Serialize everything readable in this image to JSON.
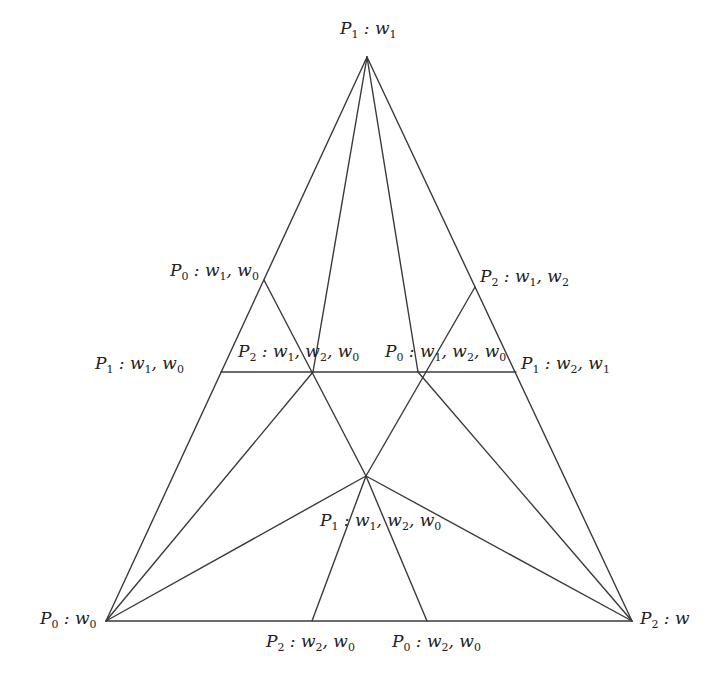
{
  "diagram": {
    "type": "triangulated-simplex",
    "stroke_color": "#3a3a3a",
    "background": "#ffffff",
    "points": {
      "top": {
        "x": 367,
        "y": 57
      },
      "bl": {
        "x": 106,
        "y": 621
      },
      "br": {
        "x": 632,
        "y": 621
      },
      "left_mid": {
        "x": 264,
        "y": 280
      },
      "right_mid": {
        "x": 475,
        "y": 287
      },
      "h_left": {
        "x": 221,
        "y": 372
      },
      "h_right": {
        "x": 516,
        "y": 372
      },
      "x_left": {
        "x": 313,
        "y": 372
      },
      "x_right": {
        "x": 418,
        "y": 372
      },
      "center": {
        "x": 366,
        "y": 476
      },
      "b_left": {
        "x": 312,
        "y": 621
      },
      "b_right": {
        "x": 427,
        "y": 621
      }
    },
    "edges": [
      [
        "top",
        "bl"
      ],
      [
        "top",
        "br"
      ],
      [
        "bl",
        "br"
      ],
      [
        "top",
        "x_left"
      ],
      [
        "top",
        "x_right"
      ],
      [
        "h_left",
        "h_right"
      ],
      [
        "left_mid",
        "center"
      ],
      [
        "right_mid",
        "center"
      ],
      [
        "bl",
        "x_left"
      ],
      [
        "br",
        "x_right"
      ],
      [
        "bl",
        "center"
      ],
      [
        "br",
        "center"
      ],
      [
        "center",
        "b_left"
      ],
      [
        "center",
        "b_right"
      ]
    ],
    "labels": [
      {
        "id": "top",
        "P": "1",
        "w": [
          "1"
        ],
        "x": 340,
        "y": 20
      },
      {
        "id": "left_mid",
        "P": "0",
        "w": [
          "1",
          "0"
        ],
        "x": 170,
        "y": 262
      },
      {
        "id": "right_mid",
        "P": "2",
        "w": [
          "1",
          "2"
        ],
        "x": 480,
        "y": 268
      },
      {
        "id": "h_left",
        "P": "1",
        "w": [
          "1",
          "0"
        ],
        "x": 95,
        "y": 355
      },
      {
        "id": "x_left",
        "P": "2",
        "w": [
          "1",
          "2",
          "0"
        ],
        "x": 238,
        "y": 343
      },
      {
        "id": "x_right",
        "P": "0",
        "w": [
          "1",
          "2",
          "0"
        ],
        "x": 385,
        "y": 343
      },
      {
        "id": "h_right",
        "P": "1",
        "w": [
          "2",
          "1"
        ],
        "x": 521,
        "y": 355
      },
      {
        "id": "center",
        "P": "1",
        "w": [
          "1",
          "2",
          "0"
        ],
        "x": 320,
        "y": 512
      },
      {
        "id": "bl",
        "P": "0",
        "w": [
          "0"
        ],
        "x": 40,
        "y": 610
      },
      {
        "id": "br",
        "P": "2",
        "w": [
          ""
        ],
        "x": 640,
        "y": 610
      },
      {
        "id": "b_left",
        "P": "2",
        "w": [
          "2",
          "0"
        ],
        "x": 266,
        "y": 633
      },
      {
        "id": "b_right",
        "P": "0",
        "w": [
          "2",
          "0"
        ],
        "x": 392,
        "y": 633
      }
    ],
    "label_text": {
      "top": "P1: w1",
      "left_mid": "P0: w1, w0",
      "right_mid": "P2: w1, w2",
      "h_left": "P1: w1, w0",
      "x_left": "P2: w1, w2, w0",
      "x_right": "P0: w1, w2, w0",
      "h_right": "P1: w2, w1",
      "center": "P1: w1, w2, w0",
      "bl": "P0: w0",
      "br": "P2: w",
      "b_left": "P2: w2, w0",
      "b_right": "P0: w2, w0"
    }
  }
}
